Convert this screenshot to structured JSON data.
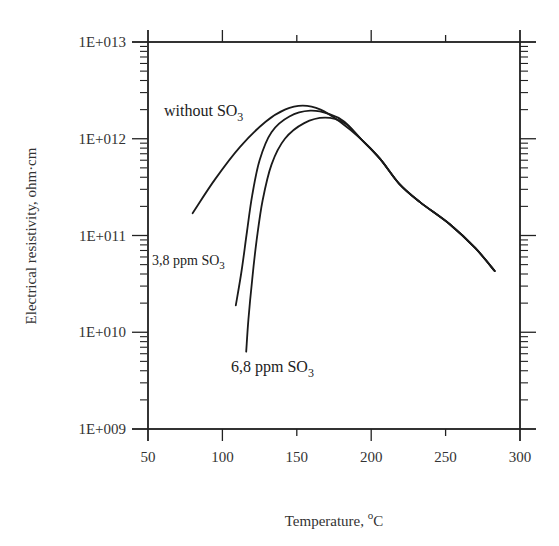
{
  "chart_data": {
    "type": "line",
    "title": "",
    "xlabel": "Temperature, °C",
    "xlabel_parts": {
      "main": "Temperature, ",
      "sup": "o",
      "unit": "C"
    },
    "ylabel": "Electrical resistivity, ohm·cm",
    "xlim": [
      50,
      300
    ],
    "ylim": [
      1000000000.0,
      10000000000000.0
    ],
    "yscale": "log",
    "grid": false,
    "legend": "inline annotations",
    "x_ticks": [
      50,
      100,
      150,
      200,
      250,
      300
    ],
    "x_tick_labels": [
      "50",
      "100",
      "150",
      "200",
      "250",
      "300"
    ],
    "y_ticks": [
      1000000000.0,
      10000000000.0,
      100000000000.0,
      1000000000000.0,
      10000000000000.0
    ],
    "y_tick_labels": [
      "1E+009",
      "1E+010",
      "1E+011",
      "1E+012",
      "1E+013"
    ],
    "series": [
      {
        "name": "without SO3",
        "label_main": "without SO",
        "label_sub": "3",
        "x": [
          80,
          95,
          112,
          129,
          142,
          154,
          166,
          179,
          193,
          206,
          219,
          233,
          253,
          270,
          283
        ],
        "values": [
          170000000000.0,
          380000000000.0,
          830000000000.0,
          1500000000000.0,
          2000000000000.0,
          2200000000000.0,
          2000000000000.0,
          1500000000000.0,
          1000000000000.0,
          620000000000.0,
          340000000000.0,
          220000000000.0,
          130000000000.0,
          74000000000.0,
          43000000000.0
        ]
      },
      {
        "name": "3,8 ppm SO3",
        "label_main": "3,8 ppm SO",
        "label_sub": "3",
        "x": [
          109,
          113,
          116.5,
          120,
          125,
          133,
          145,
          159,
          172,
          182,
          193,
          206,
          219,
          233,
          253,
          270,
          283
        ],
        "values": [
          19000000000.0,
          44000000000.0,
          110000000000.0,
          260000000000.0,
          600000000000.0,
          1170000000000.0,
          1700000000000.0,
          1950000000000.0,
          1800000000000.0,
          1500000000000.0,
          1000000000000.0,
          620000000000.0,
          340000000000.0,
          220000000000.0,
          130000000000.0,
          74000000000.0,
          43000000000.0
        ]
      },
      {
        "name": "6,8 ppm SO3",
        "label_main": "6,8 ppm SO",
        "label_sub": "3",
        "x": [
          116,
          117.5,
          120,
          123,
          127,
          133,
          142,
          155,
          169,
          182,
          193,
          206,
          219,
          233,
          253,
          270,
          283
        ],
        "values": [
          6300000000.0,
          13500000000.0,
          35000000000.0,
          89000000000.0,
          230000000000.0,
          540000000000.0,
          1000000000000.0,
          1450000000000.0,
          1650000000000.0,
          1450000000000.0,
          1000000000000.0,
          620000000000.0,
          340000000000.0,
          220000000000.0,
          130000000000.0,
          74000000000.0,
          43000000000.0
        ]
      }
    ]
  },
  "axes": {
    "x_title_main": "Temperature, ",
    "x_title_sup": "o",
    "x_title_unit": "C",
    "y_title": "Electrical resistivity, ohm·cm"
  },
  "annotations": {
    "without": {
      "main": "without SO",
      "sub": "3"
    },
    "ppm38": {
      "main": "3,8 ppm SO",
      "sub": "3"
    },
    "ppm68": {
      "main": "6,8 ppm SO",
      "sub": "3"
    }
  },
  "colors": {
    "line": "#1a1a1a",
    "axis": "#222222",
    "text": "#333333"
  }
}
